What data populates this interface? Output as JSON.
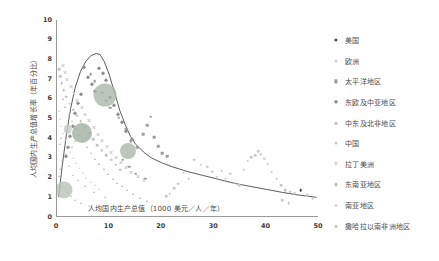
{
  "chart_data": {
    "type": "scatter",
    "title": "",
    "xlabel": "人均国内生产总值（1000 美元／人／年）",
    "ylabel": "人均国内生产总值增长率（年百分比）",
    "xlim": [
      0,
      50
    ],
    "ylim": [
      0,
      10
    ],
    "xticks": [
      "0",
      "10",
      "20",
      "30",
      "40",
      "50"
    ],
    "yticks": [
      "0",
      "1",
      "2",
      "3",
      "4",
      "5",
      "6",
      "7",
      "8",
      "9",
      "10"
    ],
    "grid": false,
    "legend_position": "right",
    "trend_line": {
      "name": "趋势线",
      "color": "#4a4a4a",
      "points": [
        [
          0.3,
          1.0
        ],
        [
          1.0,
          2.6
        ],
        [
          1.8,
          4.2
        ],
        [
          2.6,
          5.5
        ],
        [
          3.5,
          6.6
        ],
        [
          4.5,
          7.4
        ],
        [
          5.5,
          7.9
        ],
        [
          6.5,
          8.2
        ],
        [
          7.5,
          8.3
        ],
        [
          8.2,
          8.25
        ],
        [
          9.0,
          7.9
        ],
        [
          10.0,
          7.2
        ],
        [
          11.0,
          6.3
        ],
        [
          12.0,
          5.4
        ],
        [
          13.0,
          4.7
        ],
        [
          14.0,
          4.1
        ],
        [
          15.0,
          3.7
        ],
        [
          16.5,
          3.3
        ],
        [
          18.0,
          3.0
        ],
        [
          20.0,
          2.75
        ],
        [
          22.0,
          2.55
        ],
        [
          25.0,
          2.3
        ],
        [
          28.0,
          2.1
        ],
        [
          31.0,
          1.9
        ],
        [
          34.0,
          1.7
        ],
        [
          37.0,
          1.55
        ],
        [
          40.0,
          1.4
        ],
        [
          43.0,
          1.25
        ],
        [
          46.0,
          1.12
        ],
        [
          49.5,
          1.0
        ]
      ]
    },
    "series": [
      {
        "name": "美国",
        "color": "#3a3a3a",
        "marker": "dot",
        "points": [
          [
            46.5,
            1.35
          ]
        ]
      },
      {
        "name": "欧洲",
        "color": "#c9c9c9",
        "marker": "dot",
        "points": [
          [
            30.5,
            2.05
          ],
          [
            31.4,
            2.35
          ],
          [
            32.2,
            1.95
          ],
          [
            33.1,
            2.2
          ],
          [
            33.9,
            1.75
          ],
          [
            34.8,
            1.62
          ],
          [
            35.6,
            2.4
          ],
          [
            36.4,
            2.85
          ],
          [
            37.1,
            3.05
          ],
          [
            37.8,
            3.15
          ],
          [
            38.4,
            3.35
          ],
          [
            38.9,
            3.2
          ],
          [
            39.5,
            2.95
          ],
          [
            40.2,
            2.7
          ],
          [
            41.0,
            2.3
          ],
          [
            41.9,
            1.95
          ],
          [
            42.8,
            1.6
          ],
          [
            43.6,
            1.35
          ],
          [
            44.5,
            1.28
          ],
          [
            45.4,
            1.2
          ],
          [
            28.7,
            2.55
          ],
          [
            29.6,
            2.3
          ],
          [
            27.4,
            2.65
          ],
          [
            26.2,
            2.9
          ],
          [
            25.1,
            1.95
          ],
          [
            24.2,
            2.25
          ],
          [
            23.1,
            1.7
          ],
          [
            22.4,
            1.45
          ],
          [
            21.5,
            1.18
          ],
          [
            20.8,
            1.05
          ],
          [
            47.8,
            1.1
          ],
          [
            48.8,
            0.95
          ],
          [
            43.0,
            0.85
          ],
          [
            44.2,
            0.7
          ]
        ]
      },
      {
        "name": "太平洋地区",
        "color": "#9e9e9e",
        "marker": "sq",
        "points": [
          [
            11.8,
            5.05
          ],
          [
            13.2,
            4.45
          ],
          [
            14.1,
            3.85
          ],
          [
            15.3,
            3.55
          ],
          [
            16.4,
            4.2
          ],
          [
            17.2,
            4.65
          ],
          [
            17.9,
            5.1
          ],
          [
            18.5,
            4.05
          ],
          [
            19.3,
            3.6
          ],
          [
            20.1,
            3.25
          ],
          [
            21.0,
            3.1
          ],
          [
            8.6,
            6.3
          ],
          [
            9.4,
            5.9
          ],
          [
            10.2,
            5.55
          ],
          [
            7.2,
            6.9
          ],
          [
            6.4,
            7.25
          ],
          [
            12.5,
            2.9
          ],
          [
            13.8,
            2.55
          ],
          [
            15.0,
            2.2
          ],
          [
            16.8,
            1.95
          ]
        ]
      },
      {
        "name": "东欧及中亚地区",
        "color": "#8f8f8f",
        "marker": "diam",
        "points": [
          [
            5.2,
            7.6
          ],
          [
            5.9,
            7.1
          ],
          [
            6.6,
            6.75
          ],
          [
            7.3,
            6.4
          ],
          [
            8.0,
            7.55
          ],
          [
            8.7,
            7.3
          ],
          [
            9.3,
            6.95
          ],
          [
            4.6,
            6.25
          ],
          [
            4.1,
            5.8
          ],
          [
            3.5,
            5.3
          ],
          [
            10.1,
            6.1
          ],
          [
            10.9,
            5.7
          ],
          [
            11.6,
            5.25
          ],
          [
            12.4,
            4.8
          ],
          [
            3.0,
            4.6
          ],
          [
            2.5,
            4.1
          ],
          [
            13.1,
            4.35
          ],
          [
            14.3,
            3.95
          ],
          [
            2.1,
            3.55
          ],
          [
            1.7,
            3.1
          ]
        ]
      },
      {
        "name": "中东及北非地区",
        "color": "#b5b5b5",
        "marker": "tri",
        "points": [
          [
            2.2,
            5.2
          ],
          [
            2.9,
            4.85
          ],
          [
            3.6,
            4.5
          ],
          [
            4.3,
            4.15
          ],
          [
            5.0,
            3.85
          ],
          [
            5.8,
            3.55
          ],
          [
            6.5,
            3.25
          ],
          [
            7.3,
            2.95
          ],
          [
            8.1,
            2.7
          ],
          [
            9.0,
            2.45
          ],
          [
            9.8,
            2.2
          ],
          [
            10.7,
            1.95
          ],
          [
            11.5,
            1.75
          ],
          [
            12.4,
            1.55
          ],
          [
            13.3,
            1.35
          ],
          [
            1.5,
            5.6
          ],
          [
            1.1,
            6.0
          ],
          [
            14.5,
            1.15
          ],
          [
            15.8,
            0.95
          ],
          [
            17.2,
            0.8
          ]
        ]
      },
      {
        "name": "中国",
        "color": "#a8b8a8",
        "marker": "bubble",
        "points": [
          [
            9.1,
            6.2,
            23
          ]
        ]
      },
      {
        "name": "拉丁美洲",
        "color": "#cfcfcf",
        "marker": "xx",
        "points": [
          [
            3.2,
            6.3
          ],
          [
            3.9,
            5.95
          ],
          [
            4.7,
            5.6
          ],
          [
            5.4,
            5.25
          ],
          [
            6.2,
            4.9
          ],
          [
            7.0,
            4.55
          ],
          [
            7.8,
            4.2
          ],
          [
            8.6,
            3.9
          ],
          [
            9.5,
            3.6
          ],
          [
            10.4,
            3.3
          ],
          [
            11.3,
            3.05
          ],
          [
            12.2,
            2.8
          ],
          [
            13.2,
            2.55
          ],
          [
            2.6,
            6.65
          ],
          [
            2.0,
            7.0
          ],
          [
            14.2,
            2.3
          ],
          [
            15.4,
            2.1
          ],
          [
            16.6,
            1.9
          ],
          [
            1.5,
            7.35
          ],
          [
            1.1,
            7.7
          ]
        ]
      },
      {
        "name": "东南亚地区",
        "color": "#c2c2c2",
        "marker": "dot",
        "points": [
          [
            1.8,
            6.1
          ],
          [
            2.4,
            5.75
          ],
          [
            3.1,
            5.45
          ],
          [
            3.8,
            5.15
          ],
          [
            4.5,
            4.85
          ],
          [
            1.3,
            6.45
          ],
          [
            0.9,
            6.8
          ],
          [
            5.3,
            4.55
          ],
          [
            6.1,
            4.25
          ],
          [
            6.9,
            3.95
          ],
          [
            7.7,
            3.65
          ],
          [
            8.5,
            3.4
          ],
          [
            0.6,
            7.15
          ],
          [
            0.4,
            7.5
          ],
          [
            9.4,
            3.15
          ],
          [
            10.3,
            2.9
          ],
          [
            11.2,
            2.65
          ],
          [
            12.1,
            2.4
          ]
        ]
      },
      {
        "name": "南亚地区",
        "color": "#d6d6d6",
        "marker": "tri",
        "points": [
          [
            0.8,
            4.6
          ],
          [
            1.2,
            4.25
          ],
          [
            1.6,
            3.9
          ],
          [
            2.0,
            3.6
          ],
          [
            2.5,
            3.3
          ],
          [
            3.0,
            3.0
          ],
          [
            3.6,
            2.75
          ],
          [
            4.2,
            2.5
          ],
          [
            0.5,
            5.0
          ],
          [
            0.3,
            5.4
          ],
          [
            4.9,
            2.25
          ],
          [
            5.6,
            2.0
          ],
          [
            6.4,
            1.8
          ],
          [
            7.2,
            1.6
          ],
          [
            8.1,
            1.4
          ]
        ]
      },
      {
        "name": "撒哈拉以南非洲地区",
        "color": "#bdbdbd",
        "marker": "tri",
        "points": [
          [
            0.4,
            2.1
          ],
          [
            0.6,
            2.45
          ],
          [
            0.8,
            1.75
          ],
          [
            1.0,
            2.9
          ],
          [
            1.3,
            1.5
          ],
          [
            1.6,
            3.2
          ],
          [
            1.9,
            1.25
          ],
          [
            2.2,
            2.6
          ],
          [
            2.6,
            1.05
          ],
          [
            3.0,
            2.15
          ],
          [
            3.5,
            0.85
          ],
          [
            4.0,
            1.9
          ],
          [
            4.6,
            0.7
          ],
          [
            5.3,
            1.55
          ],
          [
            6.1,
            0.55
          ],
          [
            7.0,
            1.25
          ],
          [
            8.0,
            0.45
          ],
          [
            9.2,
            1.0
          ],
          [
            0.5,
            3.7
          ],
          [
            0.7,
            4.0
          ],
          [
            2.9,
            3.55
          ],
          [
            3.4,
            3.85
          ],
          [
            4.1,
            4.15
          ]
        ]
      }
    ],
    "bubbles": [
      {
        "label": "中国",
        "x": 9.1,
        "y": 6.2,
        "r": 11.5,
        "color": "#a9b6a9"
      },
      {
        "label": "印度",
        "x": 4.7,
        "y": 4.25,
        "r": 10.0,
        "color": "#9fada0"
      },
      {
        "label": "印尼",
        "x": 13.6,
        "y": 3.35,
        "r": 8.0,
        "color": "#a9b6a9"
      },
      {
        "label": "其他",
        "x": 1.4,
        "y": 1.35,
        "r": 8.5,
        "color": "#b6c0b6"
      },
      {
        "label": "其他2",
        "x": 2.1,
        "y": 4.45,
        "r": 4.2,
        "color": "#c2cbc2"
      }
    ]
  },
  "legend": {
    "items": [
      {
        "label": "美国",
        "marker": "dot",
        "color": "#4a4a4a"
      },
      {
        "label": "欧洲",
        "marker": "dot",
        "color": "#cfcfcf"
      },
      {
        "label": "太平洋地区",
        "marker": "sq",
        "color": "#9a9a9a"
      },
      {
        "label": "东欧及中亚地区",
        "marker": "diam",
        "color": "#8f8f8f"
      },
      {
        "label": "中东及北非地区",
        "marker": "tri",
        "color": "#b0b0b0"
      },
      {
        "label": "中国",
        "marker": "dot",
        "color": "#c6cec6"
      },
      {
        "label": "拉丁美洲",
        "marker": "x",
        "color": "#cccccc"
      },
      {
        "label": "东南亚地区",
        "marker": "dot",
        "color": "#c4c4c4"
      },
      {
        "label": "南亚地区",
        "marker": "tri",
        "color": "#d4d4d4"
      },
      {
        "label": "撒哈拉以南非洲地区",
        "marker": "tri",
        "color": "#bcbcbc"
      }
    ]
  },
  "colors": {
    "axis": "#9a9a9a",
    "tick_text": "#3b3b3b",
    "label_text": "#4a4a4a",
    "trend": "#4a4a4a",
    "background": "#ffffff"
  }
}
